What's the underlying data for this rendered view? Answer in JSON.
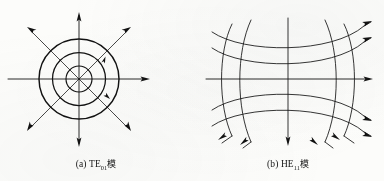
{
  "figure": {
    "background_color": "#fcfcfa",
    "ink_color": "#121212",
    "panels": [
      {
        "id": "panel-a",
        "caption_label": "(a)",
        "caption_mode": "TE",
        "caption_subscript": "01",
        "caption_cjk": "模",
        "diagram_type": "concentric-circles-radial-arrows",
        "description": "TE01 mode field pattern: three concentric circles with eight radial arrows",
        "center": {
          "x": 79,
          "y": 79
        },
        "circle_radii": [
          13,
          26.5,
          40
        ],
        "axis": {
          "horizontal_from_x": 8,
          "horizontal_to_x": 150,
          "vertical_from_y": 12,
          "vertical_to_y": 146,
          "arrow_directions": [
            "up",
            "right",
            "down"
          ]
        },
        "radial_arrow_count": 8,
        "radial_arrow_angles_deg": [
          0,
          45,
          90,
          135,
          180,
          225,
          270,
          315
        ],
        "diagonal_arrow_length": 52
      },
      {
        "id": "panel-b",
        "caption_label": "(b)",
        "caption_mode": "HE",
        "caption_subscript": "11",
        "caption_cjk": "模",
        "diagram_type": "hyperbolic-field-grid",
        "description": "HE11 mode field pattern: hyperbolic grid of electric and magnetic field lines with directional arrows",
        "center": {
          "x": 290,
          "y": 79
        },
        "vertical_curve_count": 5,
        "horizontal_curve_count": 4,
        "axis": {
          "horizontal_from_x": 210,
          "horizontal_to_x": 374,
          "vertical_from_y": 16,
          "vertical_to_y": 148,
          "arrow_directions": [
            "right",
            "down"
          ]
        },
        "arrow_count": 9
      }
    ]
  }
}
